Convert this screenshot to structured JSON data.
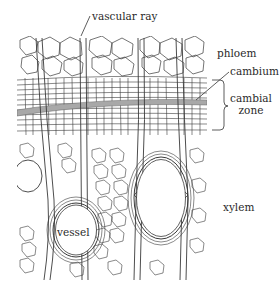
{
  "diagram": {
    "type": "botanical cross-section illustration",
    "labels": {
      "vascular_ray": "vascular ray",
      "phloem": "phloem",
      "cambium": "cambium",
      "cambial_zone_line1": "cambial",
      "cambial_zone_line2": "zone",
      "vessel": "vessel",
      "xylem": "xylem"
    },
    "colors": {
      "line": "#3a3a3a",
      "cambium_band": "#9a9a9a",
      "background": "#ffffff"
    }
  }
}
